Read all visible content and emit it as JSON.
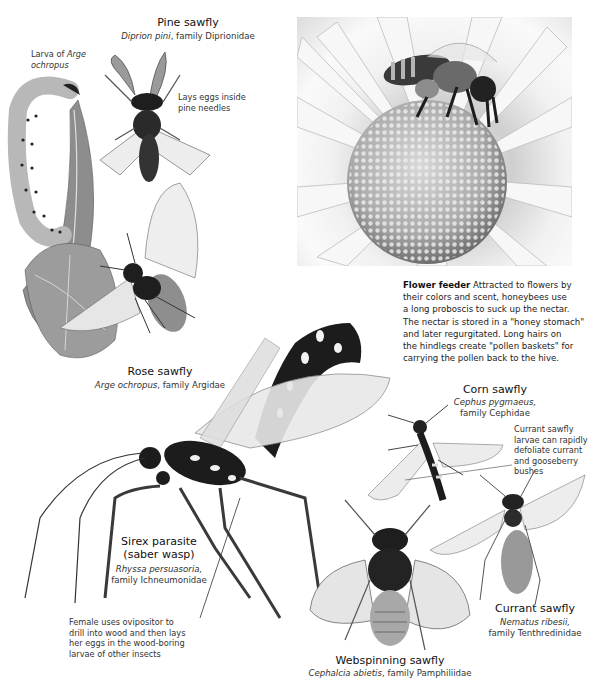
{
  "pine_sawfly": {
    "title": "Pine sawfly",
    "species": "Diprion pini",
    "family": ", family Diprionidae",
    "note": "Lays eggs inside pine needles"
  },
  "larva_label": {
    "prefix": "Larva of ",
    "species_line1": "Arge",
    "species_line2": "ochropus"
  },
  "rose_sawfly": {
    "title": "Rose sawfly",
    "species": "Arge ochropus",
    "family": ", family Argidae"
  },
  "flower_feeder": {
    "heading": "Flower feeder",
    "lines": [
      " Attracted to flowers by",
      "their colors and scent, honeybees use",
      "a long proboscis to suck up the nectar.",
      "The nectar is stored in a \"honey stomach\"",
      "and later regurgitated. Long hairs on",
      "the hindlegs create \"pollen baskets\" for",
      "carrying the pollen back to the hive."
    ]
  },
  "corn_sawfly": {
    "title": "Corn sawfly",
    "species": "Cephus pygmaeus,",
    "family": "family Cephidae"
  },
  "currant_note": {
    "lines": [
      "Currant sawfly",
      "larvae can rapidly",
      "defoliate currant",
      "and gooseberry",
      "bushes"
    ]
  },
  "sirex_parasite": {
    "title_line1": "Sirex parasite",
    "title_line2": "(saber wasp)",
    "species": "Rhyssa persuasoria,",
    "family": "family Ichneumonidae"
  },
  "ovipositor_note": {
    "lines": [
      "Female uses ovipositor to",
      "drill into wood and then lays",
      "her eggs in the wood-boring",
      "larvae of other insects"
    ]
  },
  "currant_sawfly": {
    "title": "Currant sawfly",
    "species": "Nematus ribesii,",
    "family": "family Tenthredinidae"
  },
  "webspinning_sawfly": {
    "title": "Webspinning sawfly",
    "species": "Cephalcia abietis",
    "family": ", family Pamphiliidae"
  },
  "colors": {
    "text": "#1e1e1e",
    "illustration_dark": "#1a1a1a",
    "illustration_mid": "#8a8a8a",
    "wing": "#e9e9e9"
  }
}
